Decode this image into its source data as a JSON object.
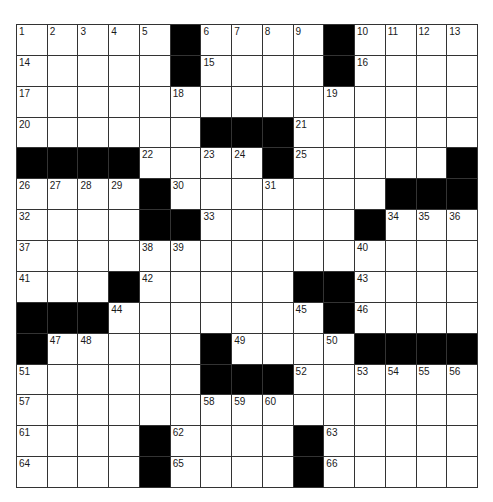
{
  "puzzle": {
    "rows": 15,
    "cols": 15,
    "colors": {
      "black": "#000000",
      "white": "#ffffff",
      "line": "#333333"
    },
    "layout": [
      ".....#....#....",
      ".....#....#....",
      "...............",
      "......###......",
      "####....#.....#",
      "....#.......###",
      "....##.....#...",
      "...............",
      "...#.....##....",
      "###.......#....",
      "#.....#....####",
      "......###......",
      "...............",
      "....#....#.....",
      "....#....#....."
    ],
    "numbers": [
      {
        "r": 0,
        "c": 0,
        "n": 1
      },
      {
        "r": 0,
        "c": 1,
        "n": 2
      },
      {
        "r": 0,
        "c": 2,
        "n": 3
      },
      {
        "r": 0,
        "c": 3,
        "n": 4
      },
      {
        "r": 0,
        "c": 4,
        "n": 5
      },
      {
        "r": 0,
        "c": 6,
        "n": 6
      },
      {
        "r": 0,
        "c": 7,
        "n": 7
      },
      {
        "r": 0,
        "c": 8,
        "n": 8
      },
      {
        "r": 0,
        "c": 9,
        "n": 9
      },
      {
        "r": 0,
        "c": 11,
        "n": 10
      },
      {
        "r": 0,
        "c": 12,
        "n": 11
      },
      {
        "r": 0,
        "c": 13,
        "n": 12
      },
      {
        "r": 0,
        "c": 14,
        "n": 13
      },
      {
        "r": 1,
        "c": 0,
        "n": 14
      },
      {
        "r": 1,
        "c": 6,
        "n": 15
      },
      {
        "r": 1,
        "c": 11,
        "n": 16
      },
      {
        "r": 2,
        "c": 0,
        "n": 17
      },
      {
        "r": 2,
        "c": 5,
        "n": 18
      },
      {
        "r": 2,
        "c": 10,
        "n": 19
      },
      {
        "r": 3,
        "c": 0,
        "n": 20
      },
      {
        "r": 3,
        "c": 9,
        "n": 21
      },
      {
        "r": 4,
        "c": 4,
        "n": 22
      },
      {
        "r": 4,
        "c": 6,
        "n": 23
      },
      {
        "r": 4,
        "c": 7,
        "n": 24
      },
      {
        "r": 4,
        "c": 9,
        "n": 25
      },
      {
        "r": 5,
        "c": 0,
        "n": 26
      },
      {
        "r": 5,
        "c": 1,
        "n": 27
      },
      {
        "r": 5,
        "c": 2,
        "n": 28
      },
      {
        "r": 5,
        "c": 3,
        "n": 29
      },
      {
        "r": 5,
        "c": 5,
        "n": 30
      },
      {
        "r": 5,
        "c": 8,
        "n": 31
      },
      {
        "r": 6,
        "c": 0,
        "n": 32
      },
      {
        "r": 6,
        "c": 6,
        "n": 33
      },
      {
        "r": 6,
        "c": 12,
        "n": 34
      },
      {
        "r": 6,
        "c": 13,
        "n": 35
      },
      {
        "r": 6,
        "c": 14,
        "n": 36
      },
      {
        "r": 7,
        "c": 0,
        "n": 37
      },
      {
        "r": 7,
        "c": 4,
        "n": 38
      },
      {
        "r": 7,
        "c": 5,
        "n": 39
      },
      {
        "r": 7,
        "c": 11,
        "n": 40
      },
      {
        "r": 8,
        "c": 0,
        "n": 41
      },
      {
        "r": 8,
        "c": 4,
        "n": 42
      },
      {
        "r": 8,
        "c": 11,
        "n": 43
      },
      {
        "r": 9,
        "c": 3,
        "n": 44
      },
      {
        "r": 9,
        "c": 9,
        "n": 45
      },
      {
        "r": 9,
        "c": 11,
        "n": 46
      },
      {
        "r": 10,
        "c": 1,
        "n": 47
      },
      {
        "r": 10,
        "c": 2,
        "n": 48
      },
      {
        "r": 10,
        "c": 7,
        "n": 49
      },
      {
        "r": 10,
        "c": 10,
        "n": 50
      },
      {
        "r": 11,
        "c": 0,
        "n": 51
      },
      {
        "r": 11,
        "c": 9,
        "n": 52
      },
      {
        "r": 11,
        "c": 11,
        "n": 53
      },
      {
        "r": 11,
        "c": 12,
        "n": 54
      },
      {
        "r": 11,
        "c": 13,
        "n": 55
      },
      {
        "r": 11,
        "c": 14,
        "n": 56
      },
      {
        "r": 12,
        "c": 0,
        "n": 57
      },
      {
        "r": 12,
        "c": 6,
        "n": 58
      },
      {
        "r": 12,
        "c": 7,
        "n": 59
      },
      {
        "r": 12,
        "c": 8,
        "n": 60
      },
      {
        "r": 13,
        "c": 0,
        "n": 61
      },
      {
        "r": 13,
        "c": 5,
        "n": 62
      },
      {
        "r": 13,
        "c": 10,
        "n": 63
      },
      {
        "r": 14,
        "c": 0,
        "n": 64
      },
      {
        "r": 14,
        "c": 5,
        "n": 65
      },
      {
        "r": 14,
        "c": 10,
        "n": 66
      }
    ]
  }
}
